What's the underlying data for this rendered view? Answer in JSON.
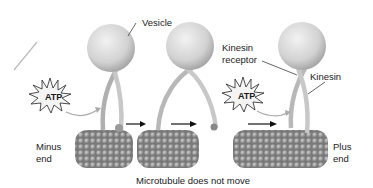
{
  "diagram": {
    "labels": {
      "vesicle": "Vesicle",
      "kinesin_receptor_line1": "Kinesin",
      "kinesin_receptor_line2": "receptor",
      "kinesin": "Kinesin",
      "minus_end_line1": "Minus",
      "minus_end_line2": "end",
      "plus_end_line1": "Plus",
      "plus_end_line2": "end",
      "caption": "Microtubule does not move"
    },
    "atp_labels": [
      "ATP",
      "ATP"
    ],
    "stages": 3,
    "colors": {
      "vesicle": "#d8d8d8",
      "kinesin": "#bdbdbd",
      "microtubule": "#8e8e8e",
      "arrow": "#111111"
    }
  }
}
